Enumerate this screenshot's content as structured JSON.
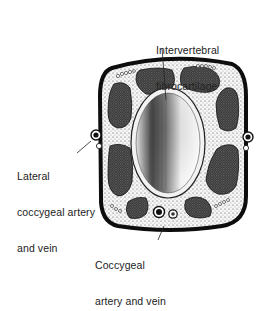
{
  "figure": {
    "colors": {
      "outline": "#0d0d0d",
      "muscle": "#3a3a3a",
      "stipple_background": "#efefef",
      "disc_light": "#f4f4f4",
      "disc_dark": "#555555",
      "text": "#222222"
    },
    "labels": {
      "intervertebral": {
        "line1": "Intervertebral",
        "line2": "fibrocartilage"
      },
      "lateral_vessels": {
        "line1": "Lateral",
        "line2": "coccygeal artery",
        "line3": "and vein"
      },
      "ventral_vessels": {
        "line1": "Coccygeal",
        "line2": "artery and vein"
      }
    }
  }
}
